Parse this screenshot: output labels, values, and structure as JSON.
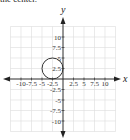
{
  "caption": "the center.",
  "chart_data": {
    "type": "scatter",
    "title": "",
    "xlabel": "x",
    "ylabel": "y",
    "xlim": [
      -12.5,
      12.5
    ],
    "ylim": [
      -12.5,
      12.5
    ],
    "grid": true,
    "grid_step": 2.5,
    "x_ticks": [
      "-10",
      "-7.5",
      "-5",
      "-2.5",
      "2.5",
      "5",
      "7.5",
      "10"
    ],
    "y_ticks": [
      "10",
      "7.5",
      "5",
      "2.5",
      "-2.5",
      "-5",
      "-7.5",
      "-10"
    ],
    "shapes": [
      {
        "type": "circle",
        "center": [
          -2.5,
          2.5
        ],
        "radius": 2.5,
        "stroke": "#333333",
        "fill": "none"
      }
    ]
  }
}
